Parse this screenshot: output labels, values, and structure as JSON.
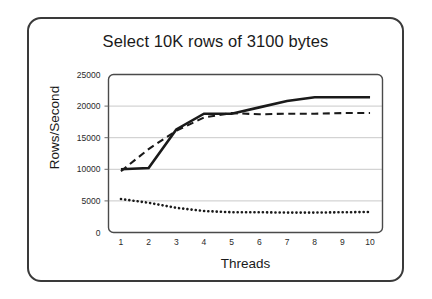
{
  "chart_data": {
    "type": "line",
    "title": "Select 10K rows of 3100 bytes",
    "xlabel": "Threads",
    "ylabel": "Rows/Second",
    "x": [
      1,
      2,
      3,
      4,
      5,
      6,
      7,
      8,
      9,
      10
    ],
    "xtick_labels": [
      "1",
      "2",
      "3",
      "4",
      "5",
      "6",
      "7",
      "8",
      "9",
      "10"
    ],
    "ytick_labels": [
      "0",
      "5000",
      "10000",
      "15000",
      "20000",
      "25000"
    ],
    "ytick_values": [
      0,
      5000,
      10000,
      15000,
      20000,
      25000
    ],
    "xlim": [
      0.55,
      10.45
    ],
    "ylim": [
      0,
      25000
    ],
    "grid": "horizontal",
    "legend": "none",
    "series": [
      {
        "name": "solid-series",
        "style": "solid",
        "color": "#1a1a1a",
        "width": 2.6,
        "values": [
          10000,
          10200,
          16300,
          18800,
          18800,
          19800,
          20800,
          21400,
          21400,
          21400
        ]
      },
      {
        "name": "dashed-series",
        "style": "dashed",
        "color": "#1a1a1a",
        "width": 2.1,
        "values": [
          9700,
          13200,
          16100,
          18200,
          18900,
          18700,
          18800,
          18800,
          18900,
          18900
        ]
      },
      {
        "name": "dotted-series",
        "style": "dotted",
        "color": "#1a1a1a",
        "width": 2.6,
        "values": [
          5300,
          4700,
          3900,
          3400,
          3200,
          3200,
          3150,
          3150,
          3200,
          3250
        ]
      }
    ]
  },
  "colors": {
    "frame_border": "#3a3a3a",
    "plot_border": "#4a4a4a",
    "gridline": "#c9c9c9",
    "background": "#ffffff",
    "text": "#1a1a1a"
  }
}
